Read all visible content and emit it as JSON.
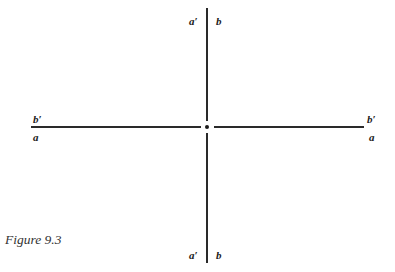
{
  "figure": {
    "caption": "Figure 9.3",
    "labels": {
      "top_left": "a′",
      "top_right": "b",
      "bottom_left": "a′",
      "bottom_right": "b",
      "left_above": "b′",
      "left_below": "a",
      "right_above": "b′",
      "right_below": "a"
    },
    "center_marker": "dot"
  }
}
